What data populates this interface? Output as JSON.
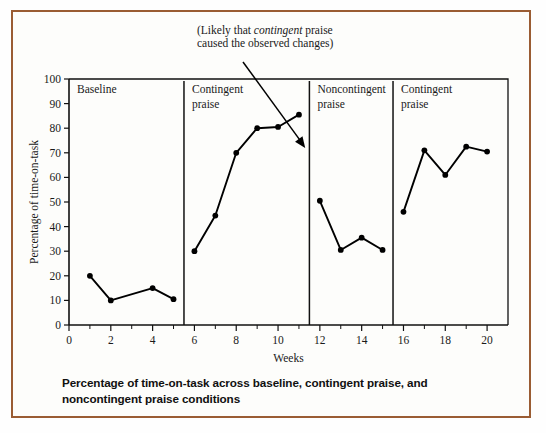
{
  "figure": {
    "caption": "Percentage of time-on-task across baseline, contingent praise, and noncontingent praise conditions",
    "border_color": "#9a5c33",
    "background_color": "#fdfdfb"
  },
  "annotation": {
    "line1_prefix": "(Likely that ",
    "line1_emphasis": "contingent",
    "line1_suffix": " praise",
    "line2": "caused the observed changes)",
    "points_to_week": 11.3,
    "points_to_value": 72
  },
  "chart_data": {
    "type": "line",
    "title": "",
    "xlabel": "Weeks",
    "ylabel": "Percentage of time-on-task",
    "xlim": [
      0,
      21
    ],
    "ylim": [
      0,
      100
    ],
    "grid": false,
    "legend": "none",
    "xticks": [
      0,
      2,
      4,
      6,
      8,
      10,
      12,
      14,
      16,
      18,
      20
    ],
    "xtick_labels": [
      "0",
      "2",
      "4",
      "6",
      "8",
      "10",
      "12",
      "14",
      "16",
      "18",
      "20"
    ],
    "xticks_minor": [
      1,
      3,
      5,
      7,
      9,
      11,
      13,
      15,
      17,
      19
    ],
    "yticks": [
      0,
      10,
      20,
      30,
      40,
      50,
      60,
      70,
      80,
      90,
      100
    ],
    "ytick_labels": [
      "0",
      "10",
      "20",
      "30",
      "40",
      "50",
      "60",
      "70",
      "80",
      "90",
      "100"
    ],
    "marker": "filled-circle",
    "line_color": "#000000",
    "phase_dividers": [
      5.5,
      11.5,
      15.5
    ],
    "phases": [
      {
        "name": "baseline",
        "label_line1": "Baseline",
        "label_line2": "",
        "start_week": 0,
        "end_week": 5.5
      },
      {
        "name": "contingent-praise-1",
        "label_line1": "Contingent",
        "label_line2": "praise",
        "start_week": 5.5,
        "end_week": 11.5
      },
      {
        "name": "noncontingent-praise",
        "label_line1": "Noncontingent",
        "label_line2": "praise",
        "start_week": 11.5,
        "end_week": 15.5
      },
      {
        "name": "contingent-praise-2",
        "label_line1": "Contingent",
        "label_line2": "praise",
        "start_week": 15.5,
        "end_week": 21
      }
    ],
    "series": [
      {
        "name": "Baseline",
        "x": [
          1,
          2,
          4,
          5
        ],
        "values": [
          20,
          10,
          15,
          10.5
        ]
      },
      {
        "name": "Contingent praise",
        "x": [
          6,
          7,
          8,
          9,
          10,
          11
        ],
        "values": [
          30,
          44.5,
          70,
          80,
          80.5,
          85.5
        ]
      },
      {
        "name": "Noncontingent praise",
        "x": [
          12,
          13,
          14,
          15
        ],
        "values": [
          50.5,
          30.5,
          35.5,
          30.5
        ]
      },
      {
        "name": "Contingent praise (return)",
        "x": [
          16,
          17,
          18,
          19,
          20
        ],
        "values": [
          46,
          71,
          61,
          72.5,
          70.5
        ]
      }
    ]
  }
}
